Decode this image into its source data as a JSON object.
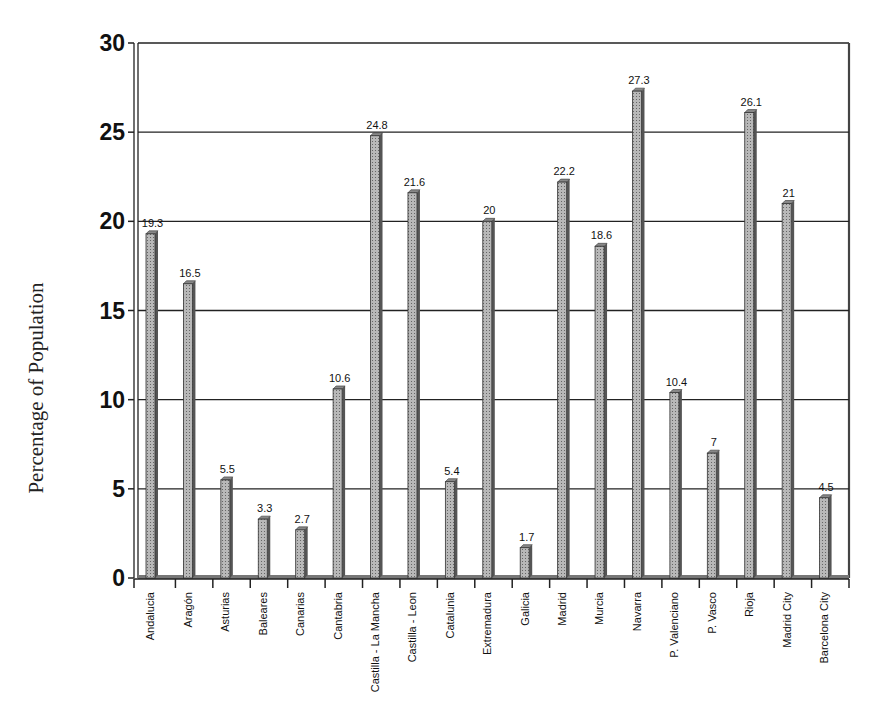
{
  "chart_data": {
    "type": "bar",
    "title": "",
    "xlabel": "",
    "ylabel": "Percentage of Population",
    "ylim": [
      0,
      30
    ],
    "yticks": [
      0,
      5,
      10,
      15,
      20,
      25,
      30
    ],
    "grid": true,
    "legend": null,
    "categories": [
      "Andalucia",
      "Aragón",
      "Asturias",
      "Baleares",
      "Canarias",
      "Cantabria",
      "Castilla - La Mancha",
      "Castilla - Leon",
      "Catalunia",
      "Extremadura",
      "Galicia",
      "Madrid",
      "Murcia",
      "Navarra",
      "P. Valenciano",
      "P. Vasco",
      "Rioja",
      "Madrid City",
      "Barcelona City"
    ],
    "values": [
      19.3,
      16.5,
      5.5,
      3.3,
      2.7,
      10.6,
      24.8,
      21.6,
      5.4,
      20,
      1.7,
      22.2,
      18.6,
      27.3,
      10.4,
      7,
      26.1,
      21,
      4.5
    ],
    "value_labels": [
      "19.3",
      "16.5",
      "5.5",
      "3.3",
      "2.7",
      "10.6",
      "24.8",
      "21.6",
      "5.4",
      "20",
      "1.7",
      "22.2",
      "18.6",
      "27.3",
      "10.4",
      "7",
      "26.1",
      "21",
      "4.5"
    ]
  },
  "colors": {
    "bar_fill": "#a8a8a8",
    "bar_dark": "#555555",
    "grid": "#222222",
    "text": "#111111"
  }
}
